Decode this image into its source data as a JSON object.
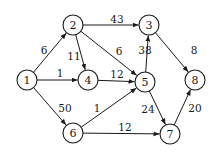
{
  "graph": {
    "radius": 10,
    "color": "#1a1a1a",
    "nodes": [
      {
        "id": "1",
        "x": 27,
        "y": 80
      },
      {
        "id": "2",
        "x": 73,
        "y": 25
      },
      {
        "id": "3",
        "x": 149,
        "y": 25
      },
      {
        "id": "4",
        "x": 88,
        "y": 80
      },
      {
        "id": "5",
        "x": 145,
        "y": 82
      },
      {
        "id": "6",
        "x": 73,
        "y": 133
      },
      {
        "id": "7",
        "x": 170,
        "y": 134
      },
      {
        "id": "8",
        "x": 195,
        "y": 80
      }
    ],
    "edges": [
      {
        "from": "1",
        "to": "2",
        "weight": "6",
        "lx": 44,
        "ly": 50
      },
      {
        "from": "1",
        "to": "4",
        "weight": "1",
        "lx": 60,
        "ly": 73
      },
      {
        "from": "1",
        "to": "6",
        "weight": "50",
        "lx": 65,
        "ly": 108
      },
      {
        "from": "2",
        "to": "3",
        "weight": "43",
        "lx": 117,
        "ly": 19
      },
      {
        "from": "2",
        "to": "4",
        "weight": "11",
        "lx": 74,
        "ly": 56
      },
      {
        "from": "2",
        "to": "5",
        "weight": "6",
        "lx": 119,
        "ly": 51
      },
      {
        "from": "4",
        "to": "5",
        "weight": "12",
        "lx": 117,
        "ly": 74
      },
      {
        "from": "5",
        "to": "3",
        "weight": "38",
        "lx": 145,
        "ly": 50
      },
      {
        "from": "6",
        "to": "5",
        "weight": "1",
        "lx": 97,
        "ly": 108
      },
      {
        "from": "6",
        "to": "7",
        "weight": "12",
        "lx": 125,
        "ly": 127
      },
      {
        "from": "5",
        "to": "7",
        "weight": "24",
        "lx": 148,
        "ly": 109
      },
      {
        "from": "3",
        "to": "8",
        "weight": "8",
        "lx": 194,
        "ly": 50
      },
      {
        "from": "7",
        "to": "8",
        "weight": "20",
        "lx": 195,
        "ly": 108
      }
    ]
  }
}
